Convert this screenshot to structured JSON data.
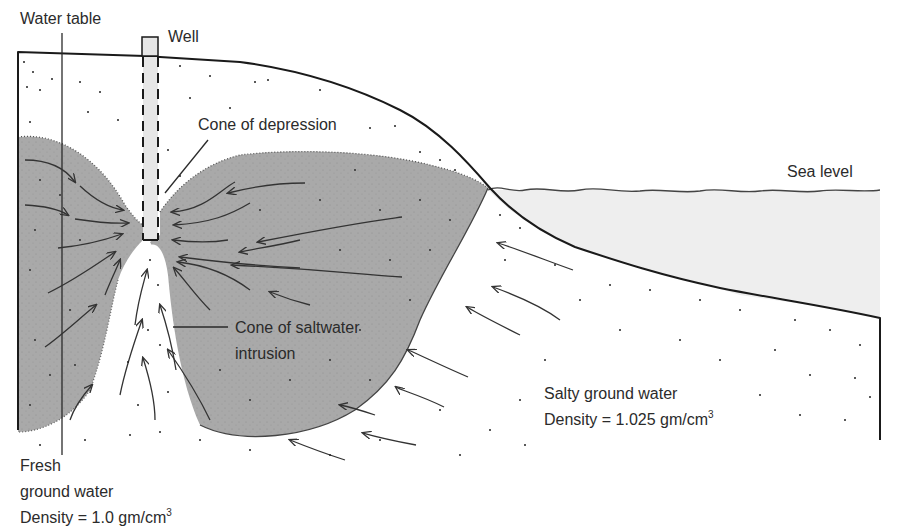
{
  "diagram": {
    "colors": {
      "fresh_water_fill": "#a9a9a9",
      "sea_fill": "#eeeeee",
      "well_fill": "#e6e6e6",
      "outline": "#1a1a1a",
      "text": "#2b2b2b"
    },
    "labels": {
      "water_table": "Water table",
      "well": "Well",
      "cone_of_depression": "Cone of depression",
      "sea_level": "Sea level",
      "cone_saltwater_line1": "Cone of saltwater",
      "cone_saltwater_line2": "intrusion",
      "salty_line1": "Salty ground water",
      "salty_line2_prefix": "Density  =  1.025 gm/cm",
      "salty_line2_sup": "3",
      "fresh_line1": "Fresh",
      "fresh_line2": "ground water",
      "fresh_line3_prefix": "Density  =  1.0 gm/cm",
      "fresh_line3_sup": "3"
    },
    "regions": [
      {
        "name": "fresh-ground-water",
        "density": "1.0 gm/cm3"
      },
      {
        "name": "salty-ground-water",
        "density": "1.025 gm/cm3"
      },
      {
        "name": "sea"
      }
    ]
  }
}
